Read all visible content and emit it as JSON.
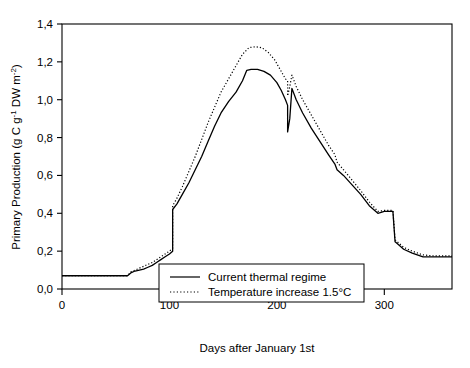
{
  "chart_data": {
    "type": "line",
    "title": "",
    "xlabel": "Days after January 1st",
    "ylabel": "Primary Production (g C g⁻¹ DW m⁻²)",
    "ylabel_parts": {
      "prefix": "Primary Production (g C g",
      "sup1": "-1",
      "mid": " DW m",
      "sup2": "-2",
      "suffix": ")"
    },
    "xlim": [
      0,
      363
    ],
    "ylim": [
      0.0,
      1.4
    ],
    "xticks": [
      0,
      100,
      200,
      300
    ],
    "xticklabels": [
      "0",
      "100",
      "200",
      "300"
    ],
    "yticks": [
      0.0,
      0.2,
      0.4,
      0.6,
      0.8,
      1.0,
      1.2,
      1.4
    ],
    "yticklabels": [
      "0,0",
      "0,2",
      "0,4",
      "0,6",
      "0,8",
      "1,0",
      "1,2",
      "1,4"
    ],
    "grid": false,
    "frame": "box",
    "legend_position": "lower center",
    "series": [
      {
        "name": "Current thermal regime",
        "style": "solid",
        "color": "#000000",
        "x": [
          0,
          10,
          22,
          34,
          46,
          56,
          61,
          64,
          68,
          72,
          76,
          80,
          84,
          88,
          92,
          96,
          100,
          103,
          103,
          107,
          112,
          118,
          124,
          130,
          136,
          142,
          148,
          155,
          162,
          168,
          172,
          176,
          182,
          188,
          194,
          200,
          204,
          208,
          210,
          210,
          212,
          214,
          214,
          218,
          224,
          232,
          240,
          248,
          254,
          256,
          262,
          270,
          278,
          286,
          294,
          300,
          305,
          308,
          310,
          312,
          318,
          326,
          336,
          346,
          356,
          363
        ],
        "y": [
          0.07,
          0.07,
          0.07,
          0.07,
          0.07,
          0.07,
          0.07,
          0.085,
          0.095,
          0.1,
          0.105,
          0.115,
          0.125,
          0.14,
          0.155,
          0.17,
          0.185,
          0.2,
          0.42,
          0.45,
          0.5,
          0.56,
          0.63,
          0.7,
          0.78,
          0.86,
          0.93,
          0.99,
          1.04,
          1.1,
          1.155,
          1.16,
          1.16,
          1.15,
          1.13,
          1.09,
          1.05,
          1.0,
          0.97,
          0.83,
          0.9,
          1.06,
          1.06,
          1.0,
          0.93,
          0.85,
          0.78,
          0.71,
          0.66,
          0.63,
          0.6,
          0.55,
          0.5,
          0.44,
          0.4,
          0.41,
          0.41,
          0.41,
          0.25,
          0.24,
          0.21,
          0.19,
          0.17,
          0.17,
          0.17,
          0.17
        ]
      },
      {
        "name": "Temperature increase 1.5°C",
        "style": "dotted",
        "color": "#000000",
        "x": [
          0,
          10,
          22,
          34,
          46,
          56,
          61,
          64,
          68,
          72,
          76,
          80,
          84,
          88,
          92,
          96,
          100,
          103,
          103,
          107,
          112,
          118,
          124,
          130,
          136,
          142,
          148,
          155,
          162,
          168,
          174,
          180,
          186,
          192,
          198,
          204,
          208,
          210,
          210,
          212,
          214,
          214,
          218,
          224,
          232,
          240,
          248,
          254,
          256,
          262,
          270,
          278,
          286,
          294,
          300,
          305,
          308,
          310,
          312,
          318,
          326,
          336,
          346,
          356,
          363
        ],
        "y": [
          0.07,
          0.07,
          0.07,
          0.07,
          0.07,
          0.07,
          0.07,
          0.09,
          0.1,
          0.11,
          0.12,
          0.13,
          0.14,
          0.155,
          0.17,
          0.185,
          0.2,
          0.215,
          0.44,
          0.48,
          0.54,
          0.62,
          0.7,
          0.79,
          0.88,
          0.96,
          1.04,
          1.11,
          1.18,
          1.24,
          1.275,
          1.28,
          1.275,
          1.25,
          1.21,
          1.15,
          1.11,
          1.1,
          1.02,
          1.07,
          1.13,
          1.13,
          1.07,
          1.0,
          0.92,
          0.84,
          0.76,
          0.71,
          0.67,
          0.63,
          0.575,
          0.52,
          0.46,
          0.41,
          0.415,
          0.415,
          0.415,
          0.26,
          0.25,
          0.22,
          0.2,
          0.18,
          0.175,
          0.175,
          0.175
        ]
      }
    ],
    "legend": {
      "entries": [
        {
          "label": "Current thermal regime",
          "style": "solid"
        },
        {
          "label": "Temperature increase 1.5°C",
          "style": "dotted"
        }
      ]
    }
  }
}
